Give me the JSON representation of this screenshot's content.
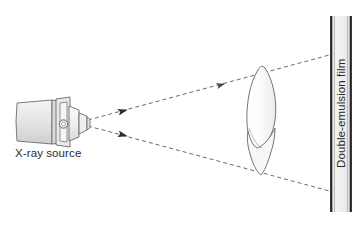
{
  "figure": {
    "type": "diagram",
    "background_color": "#ffffff"
  },
  "labels": {
    "source": "X-ray source",
    "film": "Double-emulsion film"
  },
  "components": {
    "source": {
      "name": "x-ray-source",
      "icon": "xray-tubehead-icon",
      "body_fill": "#e3e3e3",
      "body_stroke": "#6d6d6d",
      "collimator_fill": "#f2f2f2",
      "port_fill": "#ebebeb",
      "dial_stroke": "#5f5f5f"
    },
    "object": {
      "name": "tooth",
      "icon": "tooth-icon",
      "fill": "#fbfbfb",
      "stroke": "#757575"
    },
    "film": {
      "name": "double-emulsion-film",
      "fill": "#ededed",
      "edge_stroke": "#2a2a2a",
      "inner_stroke": "#9a9a9a",
      "x_left": 330,
      "x_right": 352,
      "y_top": 16,
      "y_bottom": 212
    },
    "beam": {
      "name": "x-ray-beam",
      "stroke": "#575757",
      "style": "dashed",
      "dash": "4 3",
      "width": 0.9,
      "origin": [
        88,
        122
      ],
      "upper_end": [
        348,
        52
      ],
      "lower_end": [
        348,
        195
      ],
      "arrow_positions": [
        "mid-upper",
        "mid-lower",
        "film-upper",
        "film-lower"
      ]
    }
  }
}
